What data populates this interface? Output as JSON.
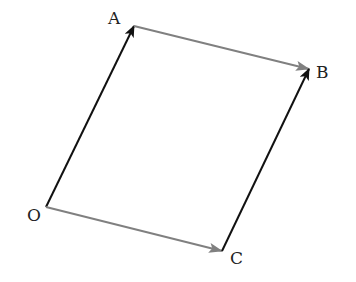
{
  "diagram": {
    "colors": {
      "dark_vector": "#111111",
      "gray_vector": "#808080",
      "label": "#222222"
    },
    "points": {
      "O": {
        "label": "O",
        "x": 46,
        "y": 207,
        "label_x": 27,
        "label_y": 221
      },
      "A": {
        "label": "A",
        "x": 134,
        "y": 26,
        "label_x": 108,
        "label_y": 24
      },
      "B": {
        "label": "B",
        "x": 309,
        "y": 69,
        "label_x": 316,
        "label_y": 78
      },
      "C": {
        "label": "C",
        "x": 222,
        "y": 251,
        "label_x": 230,
        "label_y": 264
      }
    },
    "vectors": [
      {
        "from": "O",
        "to": "A",
        "color": "dark"
      },
      {
        "from": "A",
        "to": "B",
        "color": "gray"
      },
      {
        "from": "O",
        "to": "C",
        "color": "gray"
      },
      {
        "from": "C",
        "to": "B",
        "color": "dark"
      }
    ]
  }
}
